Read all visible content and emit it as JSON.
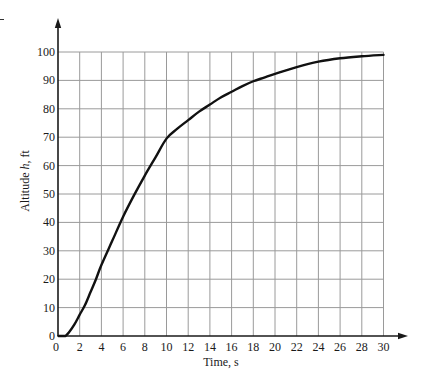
{
  "chart_data": {
    "type": "line",
    "title": "",
    "xlabel": "Time, s",
    "ylabel": "Altitude h, ft",
    "ylabel_parts": {
      "before": "Altitude ",
      "var": "h",
      "after": ", ft"
    },
    "xlim": [
      0,
      30
    ],
    "ylim": [
      0,
      100
    ],
    "x_ticks": [
      0,
      2,
      4,
      6,
      8,
      10,
      12,
      14,
      16,
      18,
      20,
      22,
      24,
      26,
      28,
      30
    ],
    "y_ticks": [
      0,
      10,
      20,
      30,
      40,
      50,
      60,
      70,
      80,
      90,
      100
    ],
    "grid": true,
    "legend": null,
    "axis_arrows": true,
    "series": [
      {
        "name": "Altitude h",
        "x": [
          0.7,
          1,
          1.5,
          2,
          2.5,
          3,
          3.5,
          4,
          5,
          6,
          7,
          8,
          9,
          10,
          11,
          12,
          13,
          14,
          15,
          16,
          17,
          18,
          19,
          20,
          22,
          24,
          26,
          28,
          30
        ],
        "y": [
          0,
          1.2,
          4,
          7.5,
          11,
          15.5,
          20,
          25,
          33.5,
          42,
          49.5,
          56.5,
          63,
          69.5,
          73,
          76,
          79,
          81.5,
          84,
          86,
          88,
          89.7,
          91,
          92.3,
          94.7,
          96.6,
          97.8,
          98.5,
          99
        ]
      }
    ]
  },
  "colors": {
    "background": "#ffffff",
    "curve": "#111111",
    "axis": "#1a1a1a",
    "grid": "#9a9a9a",
    "text": "#1a1a1a"
  }
}
